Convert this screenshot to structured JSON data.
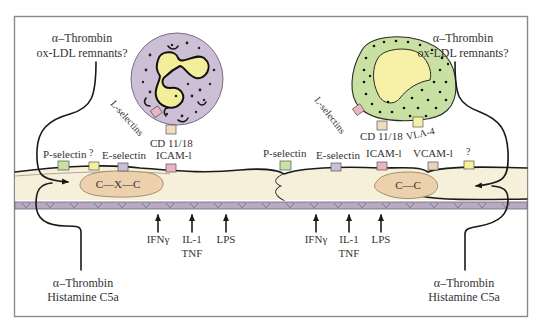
{
  "figure": {
    "colors": {
      "frame": "#8a8a8a",
      "endothelium": "#f6efd9",
      "endothelium_outline": "#1a1a1a",
      "basement_membrane": "#b7abc2",
      "nucleus_cxc": "#ecd1ac",
      "nucleus_cc": "#ecd1ac",
      "neutrophil_body": "#cdbfd6",
      "neutrophil_nucleus": "#f4ed9a",
      "monocyte_body": "#c9e0a3",
      "monocyte_nucleus": "#f7f1a7",
      "p_selectin": "#c8e2a6",
      "unknown_receptor": "#f5f09a",
      "e_selectin": "#cbbfd6",
      "icam1": "#eab4c2",
      "vcam1": "#ecd3b8",
      "l_selectin": "#eab4c0",
      "cd11_18": "#f1dcc0",
      "vla4": "#f5f0a5"
    },
    "top_left": {
      "line1": "α–Thrombin",
      "line2": "ox-LDL remnants?"
    },
    "top_right": {
      "line1": "α–Thrombin",
      "line2": "ox-LDL remnants?"
    },
    "bottom_left": {
      "line1": "α–Thrombin",
      "line2": "Histamine C5a"
    },
    "bottom_right": {
      "line1": "α–Thrombin",
      "line2": "Histamine C5a"
    },
    "neutrophil": {
      "l_selectin_label": "L-selectins",
      "cd_label": "CD 11/18"
    },
    "monocyte": {
      "l_selectin_label": "L-selectins",
      "cd_label": "CD 11/18",
      "vla4_label": "VLA-4"
    },
    "left_receptors": {
      "p_selectin": "P-selectin",
      "unknown": "?",
      "e_selectin": "E-selectin",
      "icam": "ICAM-l"
    },
    "right_receptors": {
      "p_selectin": "P-selectin",
      "e_selectin": "E-selectin",
      "icam": "ICAM-l",
      "vcam": "VCAM-l",
      "unknown": "?"
    },
    "left_nucleus": "C—X—C",
    "right_nucleus": "C—C",
    "left_stimuli": {
      "ifn": "IFNγ",
      "il1": "IL-1",
      "tnf": "TNF",
      "lps": "LPS"
    },
    "right_stimuli": {
      "ifn": "IFNγ",
      "il1": "IL-1",
      "tnf": "TNF",
      "lps": "LPS"
    }
  }
}
